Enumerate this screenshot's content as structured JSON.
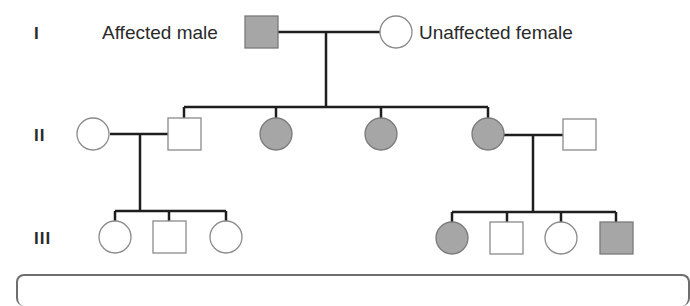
{
  "legend": {
    "affected_male": "Affected male",
    "unaffected_female": "Unaffected female"
  },
  "generations": [
    "I",
    "II",
    "III"
  ],
  "colors": {
    "affected_fill": "#a6a6a6",
    "unaffected_fill": "#ffffff",
    "line": "#1e1e1e",
    "shape_stroke": "#8a8a8a"
  },
  "pedigree": {
    "generation_I": [
      {
        "sex": "male",
        "affected": true
      },
      {
        "sex": "female",
        "affected": false
      }
    ],
    "generation_II": [
      {
        "sex": "female",
        "affected": false,
        "note": "married in"
      },
      {
        "sex": "male",
        "affected": false
      },
      {
        "sex": "female",
        "affected": true
      },
      {
        "sex": "female",
        "affected": true
      },
      {
        "sex": "female",
        "affected": true
      },
      {
        "sex": "male",
        "affected": false,
        "note": "married in"
      }
    ],
    "generation_III_left": [
      {
        "sex": "female",
        "affected": false
      },
      {
        "sex": "male",
        "affected": false
      },
      {
        "sex": "female",
        "affected": false
      }
    ],
    "generation_III_right": [
      {
        "sex": "female",
        "affected": true
      },
      {
        "sex": "male",
        "affected": false
      },
      {
        "sex": "female",
        "affected": false
      },
      {
        "sex": "male",
        "affected": true
      }
    ]
  }
}
